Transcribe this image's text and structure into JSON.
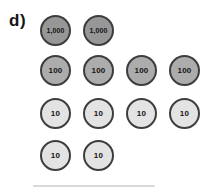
{
  "figure": {
    "label": "d)",
    "background": "#ffffff",
    "outline_color": "#3d3d3d",
    "text_color": "#141414",
    "rows": [
      {
        "name": "thousands",
        "value_label": "1,000",
        "count": 2,
        "fill": "#979797"
      },
      {
        "name": "hundreds",
        "value_label": "100",
        "count": 4,
        "fill": "#acacac"
      },
      {
        "name": "tens-row-1",
        "value_label": "10",
        "count": 4,
        "fill": "#e3e3e3"
      },
      {
        "name": "tens-row-2",
        "value_label": "10",
        "count": 2,
        "fill": "#e3e3e3"
      }
    ]
  }
}
